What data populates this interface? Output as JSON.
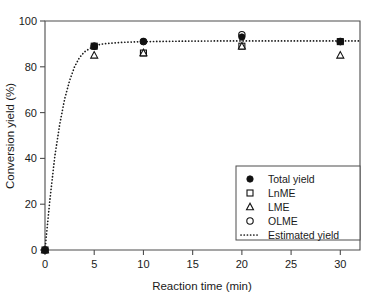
{
  "chart_data": {
    "type": "scatter",
    "title": "",
    "xlabel": "Reaction time (min)",
    "ylabel": "Conversion yield (%)",
    "xlim": [
      0,
      32
    ],
    "ylim": [
      0,
      100
    ],
    "xticks": [
      0,
      5,
      10,
      15,
      20,
      25,
      30
    ],
    "xtick_labels": [
      "0",
      "5",
      "10",
      "15",
      "20",
      "25",
      "30"
    ],
    "yticks": [
      0,
      20,
      40,
      60,
      80,
      100
    ],
    "ytick_labels": [
      "0",
      "20",
      "40",
      "60",
      "80",
      "100"
    ],
    "grid": false,
    "legend_position": "lower right",
    "x": [
      0,
      5,
      10,
      20,
      30
    ],
    "series": [
      {
        "name": "Total yield",
        "marker": "filled-circle",
        "x": [
          0,
          5,
          10,
          20,
          30
        ],
        "values": [
          0,
          89,
          91,
          93,
          91
        ]
      },
      {
        "name": "LnME",
        "marker": "open-square",
        "x": [
          0,
          5,
          10,
          20,
          30
        ],
        "values": [
          0,
          89,
          86,
          89,
          91
        ]
      },
      {
        "name": "LME",
        "marker": "open-triangle",
        "x": [
          0,
          5,
          10,
          20,
          30
        ],
        "values": [
          0,
          85,
          86,
          89,
          85
        ]
      },
      {
        "name": "OLME",
        "marker": "open-circle",
        "x": [
          0,
          5,
          10,
          20,
          30
        ],
        "values": [
          0,
          89,
          91,
          94,
          91
        ]
      },
      {
        "name": "Estimated yield",
        "marker": "dotted-line",
        "x": [
          0,
          0.5,
          1,
          1.5,
          2,
          2.5,
          3,
          3.5,
          4,
          5,
          6,
          8,
          10,
          14,
          18,
          22,
          26,
          30,
          32
        ],
        "values": [
          0,
          22,
          41,
          55,
          66,
          74,
          80,
          84,
          86.5,
          89.2,
          90.1,
          90.7,
          91.0,
          91.2,
          91.3,
          91.3,
          91.3,
          91.3,
          91.3
        ]
      }
    ],
    "legend_entries": [
      {
        "label": "Total yield",
        "marker": "filled-circle"
      },
      {
        "label": "LnME",
        "marker": "open-square"
      },
      {
        "label": "LME",
        "marker": "open-triangle"
      },
      {
        "label": "OLME",
        "marker": "open-circle"
      },
      {
        "label": "Estimated yield",
        "marker": "dotted-line"
      }
    ]
  }
}
